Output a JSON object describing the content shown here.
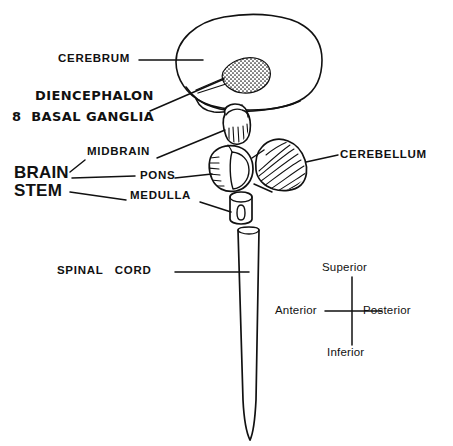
{
  "figure": {
    "background_color": "#ffffff",
    "ink_color": "#111111"
  },
  "labels": {
    "cerebrum": "CEREBRUM",
    "diencephalon": "DIENCEPHALON",
    "basal_ganglia": "8  BASAL GANGLIA",
    "midbrain": "MIDBRAIN",
    "pons": "PONS",
    "medulla": "MEDULLA",
    "brain": "BRAIN",
    "stem": "STEM",
    "cerebellum": "CEREBELLUM",
    "spinal_cord": "SPINAL   CORD"
  },
  "compass": {
    "superior": "Superior",
    "inferior": "Inferior",
    "anterior": "Anterior",
    "posterior": "Posterior"
  },
  "structures": {
    "cerebrum_name": "cerebrum-outline",
    "temporal_lobe_name": "temporal-lobe-outline",
    "basal_ganglia_name": "basal-ganglia-stipple",
    "midbrain_name": "midbrain-shape",
    "pons_name": "pons-shape",
    "medulla_name": "medulla-shape",
    "cerebellum_name": "cerebellum-shape",
    "spinal_cord_name": "spinal-cord-shape"
  }
}
